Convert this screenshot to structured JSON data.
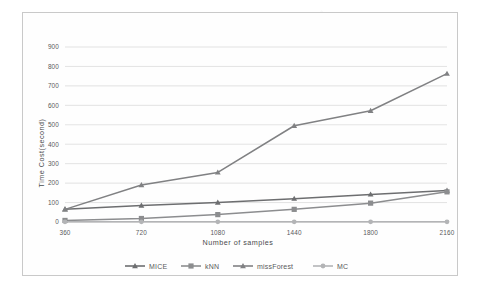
{
  "chart_data": {
    "type": "line",
    "title": "",
    "xlabel": "Number of samples",
    "ylabel": "Time Cost(second)",
    "categories": [
      "360",
      "720",
      "1080",
      "1440",
      "1800",
      "2160"
    ],
    "x": [
      360,
      720,
      1080,
      1440,
      1800,
      2160
    ],
    "ylim": [
      0,
      900
    ],
    "ytick_labels": [
      "0",
      "100",
      "200",
      "300",
      "400",
      "500",
      "600",
      "700",
      "800",
      "900"
    ],
    "yticks": [
      0,
      100,
      200,
      300,
      400,
      500,
      600,
      700,
      800,
      900
    ],
    "grid": true,
    "legend_position": "bottom",
    "series": [
      {
        "name": "MICE",
        "marker": "triangle",
        "color": "#6d6e70",
        "values": [
          65,
          85,
          100,
          120,
          142,
          162
        ]
      },
      {
        "name": "kNN",
        "marker": "square",
        "color": "#8c8d8f",
        "values": [
          8,
          18,
          38,
          65,
          97,
          155
        ]
      },
      {
        "name": "missForest",
        "marker": "triangle",
        "color": "#808183",
        "values": [
          65,
          190,
          255,
          495,
          572,
          763
        ]
      },
      {
        "name": "MC",
        "marker": "circle",
        "color": "#b3b4b6",
        "values": [
          1,
          1,
          1,
          1,
          1,
          1
        ]
      }
    ]
  },
  "legend": {
    "items": [
      {
        "label": "MICE"
      },
      {
        "label": "kNN"
      },
      {
        "label": "missForest"
      },
      {
        "label": "MC"
      }
    ]
  },
  "colors": {
    "frame_border": "#c9c9c9",
    "gridline": "#d7d7d7",
    "tick_text": "#58595b",
    "plot_background": "#fefefe"
  }
}
